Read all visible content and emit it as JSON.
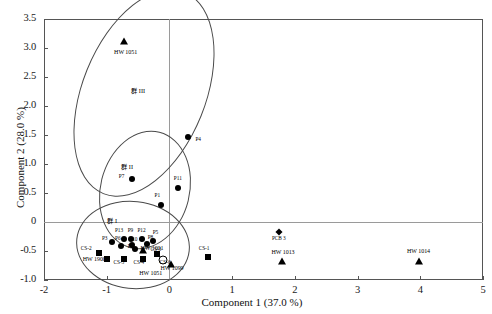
{
  "chart_data": {
    "type": "scatter",
    "title": "",
    "xlabel": "Component 1  (37.0 %)",
    "ylabel": "Component 2  (28.0 %)",
    "xlim": [
      -2,
      5
    ],
    "ylim": [
      -1.0,
      3.5
    ],
    "xticks": [
      "-2",
      "-1",
      "0",
      "1",
      "2",
      "3",
      "4",
      "5"
    ],
    "xtick_values": [
      -2,
      -1,
      0,
      1,
      2,
      3,
      4,
      5
    ],
    "yticks": [
      "3.5",
      "3.0",
      "2.5",
      "2.0",
      "1.5",
      "1.0",
      "0.5",
      "0",
      "-0.5",
      "-1.0"
    ],
    "ytick_values": [
      3.5,
      3.0,
      2.5,
      2.0,
      1.5,
      1.0,
      0.5,
      0,
      -0.5,
      -1.0
    ],
    "grid": false,
    "reference_lines": [
      {
        "axis": "x",
        "value": 0
      },
      {
        "axis": "y",
        "value": 0
      }
    ],
    "legend": "none",
    "marker_types": [
      "circle",
      "square",
      "triangle",
      "diamond",
      "open-circle"
    ],
    "points": [
      {
        "label": "HW 1051",
        "x": -0.72,
        "y": 3.12,
        "marker": "triangle",
        "lx": -0.72,
        "ly": 2.93
      },
      {
        "label": "P4",
        "x": 0.3,
        "y": 1.46,
        "marker": "circle",
        "lx": 0.46,
        "ly": 1.42
      },
      {
        "label": "P7",
        "x": -0.6,
        "y": 0.74,
        "marker": "circle",
        "lx": -0.76,
        "ly": 0.78
      },
      {
        "label": "P11",
        "x": 0.14,
        "y": 0.58,
        "marker": "circle",
        "lx": 0.14,
        "ly": 0.74
      },
      {
        "label": "P1",
        "x": -0.14,
        "y": 0.29,
        "marker": "circle",
        "lx": -0.19,
        "ly": 0.44
      },
      {
        "label": "P13",
        "x": -0.73,
        "y": -0.3,
        "marker": "circle",
        "lx": -0.8,
        "ly": -0.16
      },
      {
        "label": "P9",
        "x": -0.62,
        "y": -0.3,
        "marker": "circle",
        "lx": -0.62,
        "ly": -0.16
      },
      {
        "label": "P12",
        "x": -0.44,
        "y": -0.29,
        "marker": "circle",
        "lx": -0.44,
        "ly": -0.15
      },
      {
        "label": "P5",
        "x": -0.26,
        "y": -0.32,
        "marker": "circle",
        "lx": -0.22,
        "ly": -0.19
      },
      {
        "label": "P3",
        "x": -0.92,
        "y": -0.35,
        "marker": "circle",
        "lx": -1.03,
        "ly": -0.3
      },
      {
        "label": "P6",
        "x": -0.78,
        "y": -0.42,
        "marker": "circle",
        "lx": -0.82,
        "ly": -0.3
      },
      {
        "label": "P10",
        "x": -0.6,
        "y": -0.4,
        "marker": "circle",
        "lx": -0.57,
        "ly": -0.31
      },
      {
        "label": "P8",
        "x": -0.36,
        "y": -0.38,
        "marker": "circle",
        "lx": -0.3,
        "ly": -0.28
      },
      {
        "label": "P2",
        "x": -0.55,
        "y": -0.47,
        "marker": "circle",
        "lx": -0.62,
        "ly": -0.43
      },
      {
        "label": "HW 1001",
        "x": -0.42,
        "y": -0.48,
        "marker": "triangle",
        "lx": -0.3,
        "ly": -0.44
      },
      {
        "label": "CS-2",
        "x": -1.13,
        "y": -0.53,
        "marker": "square",
        "lx": -1.32,
        "ly": -0.46
      },
      {
        "label": "HW 1900",
        "x": -1.0,
        "y": -0.63,
        "marker": "square",
        "lx": -1.22,
        "ly": -0.64
      },
      {
        "label": "CS-5",
        "x": -0.72,
        "y": -0.63,
        "marker": "square",
        "lx": -0.8,
        "ly": -0.7
      },
      {
        "label": "CS-4",
        "x": -0.42,
        "y": -0.63,
        "marker": "square",
        "lx": -0.48,
        "ly": -0.7
      },
      {
        "label": "CS-3",
        "x": -0.2,
        "y": -0.56,
        "marker": "square",
        "lx": -0.21,
        "ly": -0.48
      },
      {
        "label": "CS-6",
        "x": -0.1,
        "y": -0.66,
        "marker": "open-circle",
        "lx": -0.06,
        "ly": -0.7
      },
      {
        "label": "HW 1051",
        "x": -0.32,
        "y": -0.8,
        "marker": "none",
        "lx": -0.32,
        "ly": -0.88
      },
      {
        "label": "HW 1099",
        "x": 0.02,
        "y": -0.72,
        "marker": "triangle",
        "lx": 0.02,
        "ly": -0.8
      },
      {
        "label": "CS-1",
        "x": 0.62,
        "y": -0.6,
        "marker": "square",
        "lx": 0.56,
        "ly": -0.47
      },
      {
        "label": "PCB 3",
        "x": 1.75,
        "y": -0.18,
        "marker": "diamond",
        "lx": 1.75,
        "ly": -0.29
      },
      {
        "label": "HW 1013",
        "x": 1.79,
        "y": -0.68,
        "marker": "triangle",
        "lx": 1.79,
        "ly": -0.52
      },
      {
        "label": "HW 1014",
        "x": 3.98,
        "y": -0.67,
        "marker": "triangle",
        "lx": 3.95,
        "ly": -0.5
      }
    ],
    "groups": [
      {
        "label": "群 III",
        "lx": -0.48,
        "ly": 2.28
      },
      {
        "label": "群 II",
        "lx": -0.64,
        "ly": 0.97
      },
      {
        "label": "群 I",
        "lx": -0.86,
        "ly": 0.04
      }
    ]
  }
}
